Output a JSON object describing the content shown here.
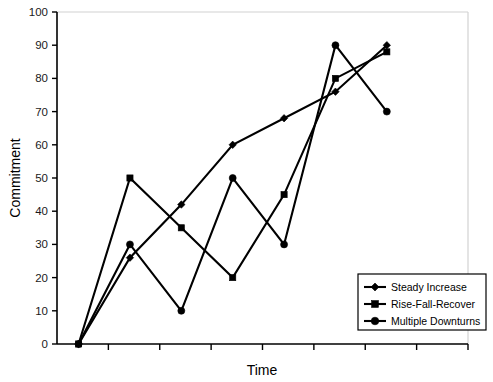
{
  "chart_data": {
    "type": "line",
    "title": "",
    "xlabel": "Time",
    "ylabel": "Commitment",
    "ylim": [
      0,
      100
    ],
    "ytick_labels": [
      "0",
      "10",
      "20",
      "30",
      "40",
      "50",
      "60",
      "70",
      "80",
      "90",
      "100"
    ],
    "ytick_values": [
      0,
      10,
      20,
      30,
      40,
      50,
      60,
      70,
      80,
      90,
      100
    ],
    "xtick_labels": [
      "",
      "",
      "",
      "",
      "",
      "",
      "",
      ""
    ],
    "x": [
      1,
      2,
      3,
      4,
      5,
      6,
      7
    ],
    "grid": false,
    "legend_position": "bottom-right",
    "series": [
      {
        "name": "Steady Increase",
        "marker": "diamond",
        "values": [
          0,
          26,
          42,
          60,
          68,
          76,
          90
        ]
      },
      {
        "name": "Rise-Fall-Recover",
        "marker": "square",
        "values": [
          0,
          50,
          35,
          20,
          45,
          80,
          88
        ]
      },
      {
        "name": "Multiple Downturns",
        "marker": "circle",
        "values": [
          0,
          30,
          10,
          50,
          30,
          90,
          70
        ]
      }
    ]
  },
  "axes": {
    "y_title": "Commitment",
    "x_title": "Time"
  },
  "legend": {
    "items": [
      {
        "label": "Steady Increase",
        "marker": "diamond"
      },
      {
        "label": "Rise-Fall-Recover",
        "marker": "square"
      },
      {
        "label": "Multiple Downturns",
        "marker": "circle"
      }
    ]
  },
  "colors": {
    "series": "#000000",
    "axis": "#000000",
    "frame": "#d2d2d2",
    "background": "#ffffff"
  }
}
